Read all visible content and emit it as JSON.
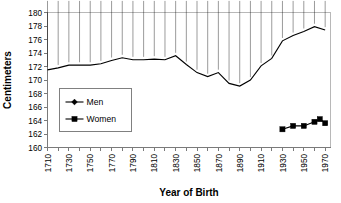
{
  "chart_data": {
    "type": "line",
    "title": "",
    "xlabel": "Year of Birth",
    "ylabel": "Centimeters",
    "xlim": [
      1710,
      1975
    ],
    "ylim": [
      160,
      180
    ],
    "ytick_step": 2,
    "xtick_step": 10,
    "xlabel_step": 20,
    "grid": false,
    "legend_position": "middle-left",
    "xticks": [
      1710,
      1720,
      1730,
      1740,
      1750,
      1760,
      1770,
      1780,
      1790,
      1800,
      1810,
      1820,
      1830,
      1840,
      1850,
      1860,
      1870,
      1880,
      1890,
      1900,
      1910,
      1920,
      1930,
      1940,
      1950,
      1960,
      1970
    ],
    "xtick_labels": [
      "1710",
      "1730",
      "1750",
      "1770",
      "1790",
      "1810",
      "1830",
      "1850",
      "1870",
      "1890",
      "1910",
      "1930",
      "1950",
      "1970"
    ],
    "xtick_label_values": [
      1710,
      1730,
      1750,
      1770,
      1790,
      1810,
      1830,
      1850,
      1870,
      1890,
      1910,
      1930,
      1950,
      1970
    ],
    "ytick_labels": [
      "160",
      "162",
      "164",
      "166",
      "168",
      "170",
      "172",
      "174",
      "176",
      "178",
      "180"
    ],
    "ytick_values": [
      160,
      162,
      164,
      166,
      168,
      170,
      172,
      174,
      176,
      178,
      180
    ],
    "series": [
      {
        "name": "Men",
        "marker": "diamond",
        "color": "#000000",
        "x": [
          1710,
          1720,
          1730,
          1740,
          1750,
          1760,
          1770,
          1780,
          1790,
          1800,
          1810,
          1820,
          1830,
          1840,
          1850,
          1860,
          1870,
          1880,
          1890,
          1900,
          1910,
          1920,
          1930,
          1940,
          1950,
          1960,
          1970
        ],
        "values": [
          171.5,
          171.8,
          172.2,
          172.2,
          172.2,
          172.4,
          172.9,
          173.3,
          173.0,
          173.0,
          173.1,
          173.0,
          173.6,
          172.3,
          171.1,
          170.5,
          171.1,
          169.5,
          169.1,
          170.0,
          172.1,
          173.2,
          175.8,
          176.6,
          177.2,
          177.9,
          177.4
        ]
      },
      {
        "name": "Women",
        "marker": "square",
        "color": "#000000",
        "x": [
          1930,
          1940,
          1950,
          1960,
          1965,
          1970
        ],
        "values": [
          162.7,
          163.2,
          163.2,
          163.8,
          164.2,
          163.6
        ]
      }
    ]
  },
  "legend": {
    "entries": [
      {
        "label": "Men",
        "marker": "diamond"
      },
      {
        "label": "Women",
        "marker": "square"
      }
    ]
  },
  "axis_titles": {
    "x": "Year of Birth",
    "y": "Centimeters"
  }
}
